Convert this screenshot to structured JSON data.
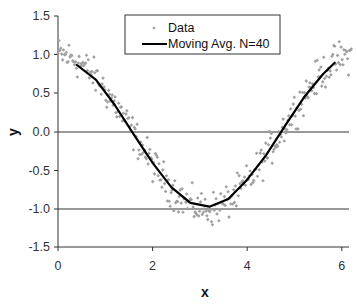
{
  "chart_data": {
    "type": "scatter",
    "title": "",
    "xlabel": "x",
    "ylabel": "y",
    "xlim": [
      0,
      6.2
    ],
    "ylim": [
      -1.5,
      1.5
    ],
    "xticks": [
      0,
      2,
      4,
      6
    ],
    "xtick_labels": [
      "0",
      "2",
      "4",
      "6"
    ],
    "yticks": [
      1.5,
      1.0,
      0.5,
      0.0,
      -0.5,
      -1.0,
      -1.5
    ],
    "ytick_labels": [
      "1.5",
      "1.0",
      "0.5",
      "0.0",
      "-0.5",
      "-1.0",
      "-1.5"
    ],
    "grid": {
      "horizontal_lines_at": [
        0.0,
        -1.0,
        -1.5
      ],
      "vertical": false
    },
    "legend": {
      "position": "top-center",
      "entries": [
        "Data",
        "Moving Avg. N=40"
      ]
    },
    "series": [
      {
        "name": "Data",
        "kind": "scatter",
        "color": "#9a9a9a",
        "description": "noisy samples of cos(x) over x in [0, 6.2], noise amplitude ~±0.2",
        "model": "y = cos(x) + noise"
      },
      {
        "name": "Moving Avg. N=40",
        "kind": "line",
        "color": "#000000",
        "x": [
          0.4,
          0.8,
          1.2,
          1.6,
          2.0,
          2.4,
          2.8,
          3.2,
          3.6,
          4.0,
          4.4,
          4.8,
          5.2,
          5.6,
          5.85
        ],
        "y": [
          0.87,
          0.68,
          0.35,
          -0.03,
          -0.4,
          -0.72,
          -0.92,
          -0.97,
          -0.87,
          -0.62,
          -0.3,
          0.08,
          0.45,
          0.75,
          0.9
        ]
      }
    ]
  },
  "legend": {
    "data_label": "Data",
    "moving_avg_label": "Moving Avg. N=40"
  },
  "axes": {
    "x_title": "x",
    "y_title": "y",
    "x_ticks": [
      "0",
      "2",
      "4",
      "6"
    ],
    "y_ticks": [
      "1.5",
      "1.0",
      "0.5",
      "0.0",
      "-0.5",
      "-1.0",
      "-1.5"
    ]
  }
}
